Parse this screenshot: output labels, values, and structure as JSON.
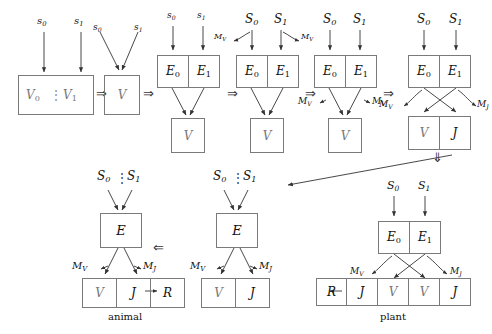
{
  "figure": {
    "type": "diagram",
    "captions": {
      "animal": "animal",
      "plant": "plant"
    },
    "symbols": {
      "s0": "s",
      "s0_sub": "0",
      "s1": "s",
      "s1_sub": "1",
      "S0": "S",
      "S0_sub": "0",
      "S1": "S",
      "S1_sub": "1",
      "E": "E",
      "E0": "E",
      "E0_sub": "0",
      "E1": "E",
      "E1_sub": "1",
      "V": "V",
      "V0": "V",
      "V0_sub": "0",
      "V1": "V",
      "V1_sub": "1",
      "J": "J",
      "R": "R",
      "MV": "M",
      "MV_sub": "V",
      "MJ": "M",
      "MJ_sub": "J"
    },
    "operators": {
      "implies_right": "⇒",
      "implies_left": "⇐",
      "implies_down": "⇓",
      "vdots": "⋮"
    },
    "stages": [
      {
        "id": "stage-1",
        "inputs": [
          "s0",
          "s1"
        ],
        "box_label": "V0 : V1",
        "note": "single box split by dotted divider"
      },
      {
        "id": "stage-2",
        "inputs": [
          "s0",
          "s1"
        ],
        "box_label": "V",
        "note": "two inputs converge onto single V box"
      },
      {
        "id": "stage-3",
        "inputs": [
          "s0",
          "s1"
        ],
        "top_cells": [
          "E0",
          "E1"
        ],
        "bottom_box": "V",
        "note": "lowercase s inputs feed E0 and E1, both converge to V"
      },
      {
        "id": "stage-4",
        "inputs": [
          "S0",
          "S1"
        ],
        "top_cells": [
          "E0",
          "E1"
        ],
        "bottom_box": "V",
        "side_labels": [
          "MV"
        ],
        "note": "uppercase S inputs with curved MV feedback arrows"
      },
      {
        "id": "stage-5",
        "inputs": [
          "S0",
          "S1"
        ],
        "top_cells": [
          "E0",
          "E1"
        ],
        "bottom_box": "V",
        "side_labels": [
          "MV",
          "MV"
        ],
        "note": "MV labels on both sides of converging arrows"
      },
      {
        "id": "stage-6",
        "inputs": [
          "S0",
          "S1"
        ],
        "top_cells": [
          "E0",
          "E1"
        ],
        "bottom_cells": [
          "V",
          "J"
        ],
        "side_labels": [
          "MV",
          "MJ"
        ],
        "note": "crossing arrows from E cells into V and J cells"
      },
      {
        "id": "stage-plant",
        "inputs": [
          "S0",
          "S1"
        ],
        "top_cells": [
          "E0",
          "E1"
        ],
        "bottom_cells": [
          "R",
          "J",
          "V",
          "V",
          "J"
        ],
        "side_labels": [
          "MV",
          "MJ"
        ],
        "caption": "plant",
        "note": "crossing arrows into a five-cell strip, J feeds R"
      },
      {
        "id": "stage-middle",
        "inputs": [
          "S0",
          "S1"
        ],
        "input_separator": "vdots",
        "top_box": "E",
        "bottom_cells": [
          "V",
          "J"
        ],
        "side_labels": [
          "MV",
          "MJ"
        ]
      },
      {
        "id": "stage-animal",
        "inputs": [
          "S0",
          "S1"
        ],
        "input_separator": "vdots",
        "top_box": "E",
        "bottom_cells": [
          "V",
          "J",
          "R"
        ],
        "side_labels": [
          "MV",
          "MJ"
        ],
        "caption": "animal",
        "note": "J feeds R in three-cell strip"
      }
    ],
    "colors": {
      "stroke": "#7a7a7a",
      "arrow": "#333333",
      "text": "#111111",
      "faded_text": "#777777",
      "background": "#ffffff"
    }
  }
}
